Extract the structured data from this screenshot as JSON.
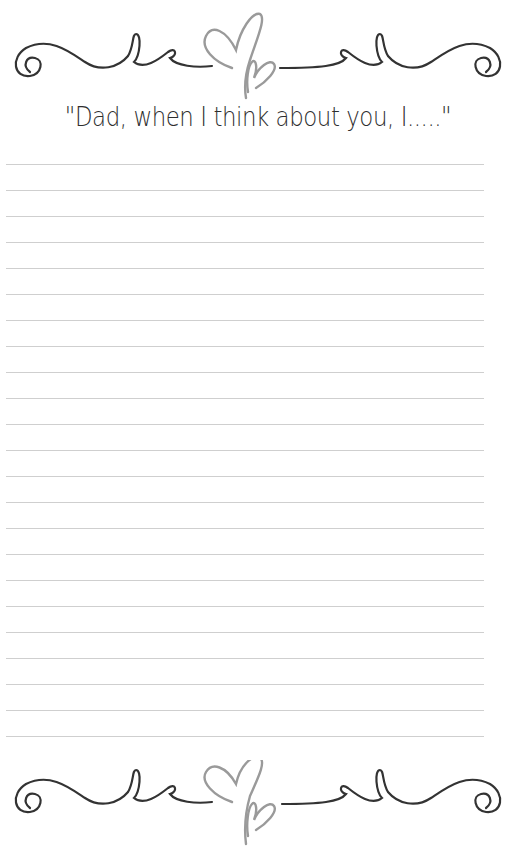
{
  "document": {
    "prompt": "\"Dad, when I think about you, I.....\"",
    "writing_lines": {
      "count": 23,
      "first_y": 164,
      "spacing": 26,
      "color": "#cfcfcf"
    },
    "ornaments": {
      "top": "swirl-flourish-with-hearts",
      "bottom": "swirl-flourish-with-hearts",
      "ink_color": "#333333",
      "heart_color": "#9a9a9a"
    }
  }
}
